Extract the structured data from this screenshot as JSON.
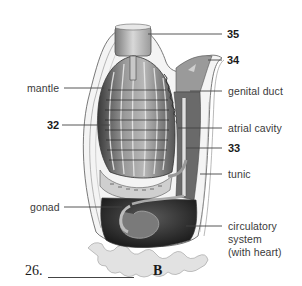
{
  "diagram": {
    "labels": {
      "n35": "35",
      "n34": "34",
      "mantle": "mantle",
      "genital_duct": "genital duct",
      "n32": "32",
      "atrial_cavity": "atrial cavity",
      "n33": "33",
      "tunic": "tunic",
      "gonad": "gonad",
      "circulatory_1": "circulatory",
      "circulatory_2": "system",
      "circulatory_3": "(with heart)"
    },
    "question": {
      "number": "26.",
      "blank": "",
      "answer_letter": "B"
    },
    "colors": {
      "line": "#444444",
      "text": "#3a3a3a",
      "body_dark": "#3c3c3c",
      "body_mid": "#8a8a8a",
      "body_light": "#d6d6d6"
    }
  }
}
